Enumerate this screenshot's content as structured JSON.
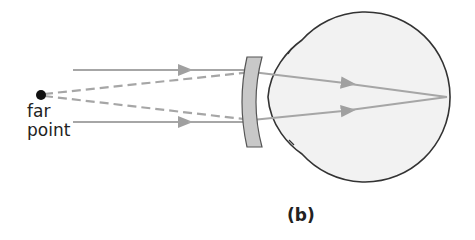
{
  "figure": {
    "caption": "(b)",
    "far_point_label_line1": "far",
    "far_point_label_line2": "point"
  },
  "elements": {
    "far_point": {
      "x": 41,
      "y": 95,
      "r": 5,
      "color": "#111111"
    },
    "ray_color": "#a6a6a6",
    "lens": {
      "type": "concave",
      "fill": "#c8c8c8",
      "stroke": "#555555"
    },
    "eye": {
      "fill": "#f2f2f2",
      "stroke": "#333333",
      "focus_point": {
        "x": 447,
        "y": 97
      }
    }
  }
}
